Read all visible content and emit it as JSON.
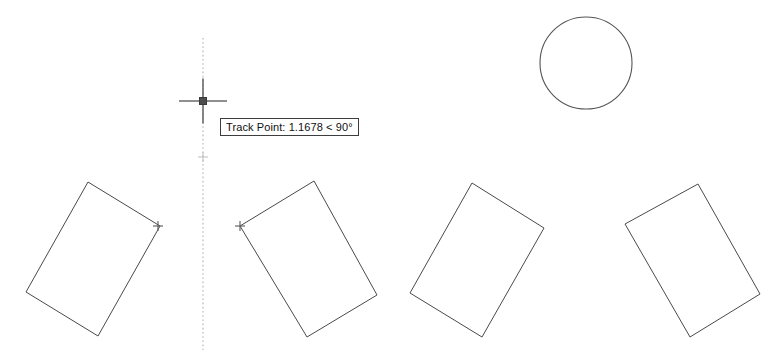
{
  "app": {
    "name": "CAD Drawing Canvas",
    "background_color": "#ffffff",
    "geometry_color": "#4a4a4a",
    "tracking_color": "#bdbdbd",
    "cursor_color": "#6a6a6a",
    "width": 781,
    "height": 363
  },
  "tooltip": {
    "label": "Track Point: 1.1678 < 90°",
    "prefix": "Track Point:",
    "distance": "1.1678",
    "separator": "<",
    "angle": "90°",
    "x": 220,
    "y": 118
  },
  "cursor": {
    "name": "crosshair-cursor",
    "x": 203,
    "y": 101,
    "horizontal_span": 48,
    "vertical_span": 45,
    "pickbox_size": 7
  },
  "tracking": {
    "name": "polar-tracking-line",
    "orientation": "vertical",
    "x": 203,
    "y_start": 38,
    "y_end": 350,
    "angle": "90°"
  },
  "markers": [
    {
      "name": "snap-marker-rect1-right",
      "x": 158,
      "y": 226,
      "style": "cross",
      "size": 5
    },
    {
      "name": "snap-marker-rect2-left",
      "x": 240,
      "y": 226,
      "style": "cross",
      "size": 5
    },
    {
      "name": "tracked-base-point",
      "x": 203,
      "y": 157,
      "style": "cross-faint",
      "size": 5
    }
  ],
  "shapes": {
    "circle": {
      "name": "circle-shape",
      "cx": 586,
      "cy": 63,
      "r": 46
    },
    "rectangles": [
      {
        "name": "rectangle-1",
        "points": "88,182 160,226 98,336 26,292"
      },
      {
        "name": "rectangle-2",
        "points": "314,181 377,295 307,337 240,226"
      },
      {
        "name": "rectangle-3",
        "points": "472,183 544,228 482,337 410,293"
      },
      {
        "name": "rectangle-4",
        "points": "698,184 760,294 690,337 625,224"
      }
    ]
  }
}
